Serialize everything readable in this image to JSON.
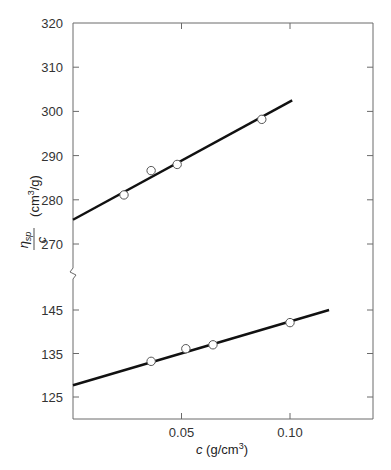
{
  "chart_data": {
    "type": "scatter",
    "title": "",
    "xlabel": "c (g/cm3)",
    "xlabel_parts": {
      "var": "c",
      "unit_pre": " (g/cm",
      "sup": "3",
      "unit_post": ")"
    },
    "ylabel": "ηsp/c (cm3/g)",
    "ylabel_parts": {
      "num": "η",
      "num_sub": "sp",
      "den": "c",
      "unit_pre": "(cm",
      "sup": "3",
      "unit_post": "/g)"
    },
    "xlim": [
      0,
      0.14
    ],
    "x_ticks": [
      0.05,
      0.1
    ],
    "x_tick_labels": [
      "0.05",
      "0.10"
    ],
    "y_axis_broken": true,
    "upper_ylim": [
      270,
      320
    ],
    "upper_y_ticks": [
      270,
      280,
      290,
      300,
      310,
      320
    ],
    "upper_y_tick_labels": [
      "270",
      "280",
      "290",
      "300",
      "310",
      "320"
    ],
    "lower_ylim": [
      120,
      150
    ],
    "lower_y_ticks": [
      125,
      135,
      145
    ],
    "lower_y_tick_labels": [
      "125",
      "135",
      "145"
    ],
    "grid": false,
    "legend": null,
    "series": [
      {
        "name": "upper",
        "marker": "open-circle",
        "x": [
          0.0235,
          0.036,
          0.048,
          0.087
        ],
        "y": [
          281.1,
          286.6,
          288.0,
          298.2
        ],
        "fit_line": {
          "x": [
            0.0,
            0.101
          ],
          "y": [
            275.5,
            302.5
          ]
        }
      },
      {
        "name": "lower",
        "marker": "open-circle",
        "x": [
          0.036,
          0.052,
          0.0645,
          0.1
        ],
        "y": [
          133.2,
          136.1,
          137.0,
          142.1
        ],
        "fit_line": {
          "x": [
            0.0,
            0.118
          ],
          "y": [
            127.7,
            145.0
          ]
        }
      }
    ]
  }
}
